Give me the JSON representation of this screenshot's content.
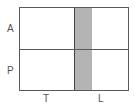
{
  "diagram": {
    "row_labels": [
      "A",
      "P"
    ],
    "column_labels": [
      "T",
      "L"
    ],
    "colors": {
      "border": "#5a5a5a",
      "band_fill": "#b4b4b4",
      "band_edge": "#444444",
      "label": "#555555",
      "background": "#ffffff"
    }
  }
}
